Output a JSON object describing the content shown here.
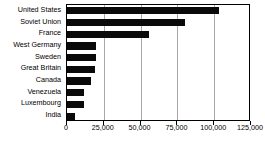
{
  "chart_data": {
    "type": "bar",
    "orientation": "horizontal",
    "title": "",
    "subtitle": "",
    "xlabel": "",
    "ylabel": "",
    "xlim": [
      0,
      125000
    ],
    "ylim": null,
    "grid": true,
    "legend": null,
    "legend_position": "none",
    "bar_color": "#0a0a0a",
    "grid_color": "#a8a8a8",
    "axis_color": "#000000",
    "background_color": "#ffffff",
    "xticks": [
      0,
      25000,
      50000,
      75000,
      100000,
      125000
    ],
    "xticklabels": [
      "0",
      "25,000",
      "50,000",
      "75,000",
      "100,000",
      "125,000"
    ],
    "categories": [
      "United States",
      "Soviet  Union",
      "France",
      "West Germany",
      "Sweden",
      "Great Britain",
      "Canada",
      "Venezuela",
      "Luxembourg",
      "India"
    ],
    "values": [
      103000,
      80000,
      56000,
      20000,
      20000,
      19000,
      16000,
      11500,
      11500,
      5500
    ]
  }
}
